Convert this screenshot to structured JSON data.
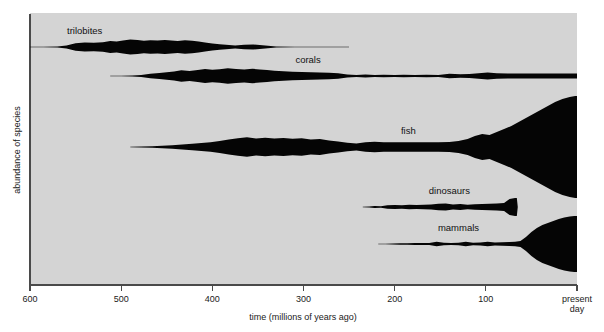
{
  "figure": {
    "type": "spindle-diagram",
    "background_color": "#ffffff",
    "panel_color": "#d4d4d4",
    "ink_color": "#050505",
    "axis_color": "#4a4a4a"
  },
  "axes": {
    "x": {
      "title": "time (millions of years ago)",
      "ticks": [
        {
          "value": 600,
          "label": "600"
        },
        {
          "value": 500,
          "label": "500"
        },
        {
          "value": 400,
          "label": "400"
        },
        {
          "value": 300,
          "label": "300"
        },
        {
          "value": 200,
          "label": "200"
        },
        {
          "value": 100,
          "label": "100"
        },
        {
          "value": 0,
          "label": "present\nday"
        }
      ],
      "range": [
        600,
        0
      ],
      "direction": "decreasing-left-to-right"
    },
    "y": {
      "title": "abundance of species",
      "ticks": [],
      "range": null
    }
  },
  "chart_data": {
    "type": "area",
    "title": "",
    "subtitle": "",
    "xlabel": "time (millions of years ago)",
    "ylabel": "abundance of species",
    "xlim": [
      600,
      0
    ],
    "ylim": null,
    "grid": false,
    "legend": "inline-labels",
    "series": [
      {
        "name": "trilobites",
        "label": "trilobites",
        "label_x": 540,
        "centerline_y_px": 47,
        "x": [
          600,
          585,
          570,
          560,
          550,
          540,
          530,
          520,
          512,
          505,
          498,
          490,
          482,
          475,
          468,
          460,
          452,
          445,
          438,
          430,
          422,
          415,
          408,
          400,
          392,
          385,
          375,
          365,
          355,
          345,
          330,
          310,
          290,
          270,
          250
        ],
        "thickness": [
          0.2,
          0.4,
          0.8,
          3.0,
          7.5,
          9.0,
          8.5,
          9.5,
          12.0,
          11.0,
          13.0,
          15.0,
          14.0,
          12.5,
          13.5,
          13.0,
          14.0,
          13.0,
          12.0,
          13.5,
          12.5,
          11.0,
          9.0,
          7.0,
          5.5,
          4.5,
          3.0,
          4.5,
          5.0,
          3.5,
          1.2,
          0.6,
          0.5,
          0.4,
          0.3
        ]
      },
      {
        "name": "corals",
        "label": "corals",
        "label_x": 295,
        "centerline_y_px": 76,
        "x": [
          512,
          500,
          488,
          478,
          468,
          458,
          450,
          442,
          434,
          425,
          416,
          408,
          400,
          392,
          383,
          374,
          365,
          356,
          348,
          340,
          332,
          322,
          312,
          302,
          292,
          282,
          272,
          262,
          252,
          242,
          232,
          222,
          212,
          200,
          190,
          178,
          165,
          152,
          140,
          128,
          118,
          108,
          98,
          88,
          76,
          62,
          48,
          34,
          20,
          8,
          0
        ],
        "thickness": [
          0.3,
          0.6,
          1.0,
          2.0,
          4.5,
          6.0,
          7.5,
          9.0,
          11.5,
          10.0,
          12.0,
          14.0,
          12.5,
          13.5,
          15.5,
          14.0,
          13.0,
          14.5,
          13.0,
          12.0,
          10.5,
          9.5,
          8.5,
          8.0,
          7.5,
          7.0,
          6.5,
          5.5,
          3.0,
          2.0,
          3.0,
          2.2,
          2.5,
          2.0,
          2.4,
          2.0,
          2.6,
          2.2,
          4.5,
          3.5,
          4.0,
          5.5,
          7.0,
          5.5,
          5.0,
          5.0,
          5.0,
          5.0,
          5.0,
          5.0,
          5.0
        ]
      },
      {
        "name": "fish",
        "label": "fish",
        "label_x": 185,
        "centerline_y_px": 147,
        "x": [
          490,
          478,
          466,
          455,
          444,
          433,
          422,
          412,
          402,
          392,
          382,
          372,
          362,
          352,
          342,
          332,
          322,
          312,
          302,
          292,
          282,
          272,
          262,
          252,
          242,
          232,
          222,
          212,
          200,
          188,
          176,
          164,
          152,
          140,
          130,
          120,
          112,
          104,
          96,
          88,
          80,
          72,
          64,
          56,
          48,
          40,
          32,
          24,
          16,
          8,
          2,
          0
        ],
        "thickness": [
          0.3,
          0.8,
          1.5,
          2.5,
          3.5,
          5.0,
          6.5,
          8.0,
          9.5,
          12.0,
          15.0,
          17.5,
          19.5,
          17.0,
          18.5,
          17.0,
          18.0,
          16.5,
          17.5,
          15.0,
          16.0,
          13.0,
          11.0,
          8.5,
          7.0,
          9.5,
          10.5,
          9.5,
          9.5,
          9.5,
          9.5,
          9.5,
          9.5,
          10.0,
          12.0,
          16.0,
          22.0,
          26.0,
          24.0,
          30.0,
          36.0,
          42.0,
          50.0,
          58.0,
          66.0,
          74.0,
          82.0,
          90.0,
          96.0,
          100.0,
          102.0,
          102.0
        ]
      },
      {
        "name": "dinosaurs",
        "label": "dinosaurs",
        "label_x": 140,
        "centerline_y_px": 207,
        "x": [
          235,
          228,
          222,
          215,
          208,
          200,
          192,
          184,
          176,
          168,
          160,
          152,
          144,
          136,
          128,
          120,
          112,
          104,
          96,
          88,
          80,
          74,
          68,
          66,
          65
        ],
        "thickness": [
          0.3,
          0.8,
          2.0,
          1.5,
          3.5,
          4.0,
          3.5,
          4.5,
          4.0,
          4.5,
          5.0,
          6.5,
          7.0,
          5.0,
          6.0,
          4.5,
          5.5,
          6.0,
          6.5,
          7.0,
          8.0,
          16.0,
          18.0,
          18.0,
          0.0
        ]
      },
      {
        "name": "mammals",
        "label": "mammals",
        "label_x": 130,
        "centerline_y_px": 244,
        "x": [
          218,
          210,
          202,
          194,
          186,
          178,
          170,
          162,
          154,
          146,
          138,
          130,
          122,
          114,
          106,
          98,
          90,
          82,
          74,
          68,
          62,
          56,
          50,
          44,
          38,
          32,
          26,
          20,
          14,
          8,
          3,
          0
        ],
        "thickness": [
          0.3,
          0.6,
          1.0,
          1.4,
          1.6,
          1.8,
          2.0,
          2.2,
          4.5,
          2.5,
          2.2,
          2.4,
          4.5,
          2.6,
          2.8,
          4.5,
          3.0,
          3.5,
          4.0,
          4.5,
          6.0,
          14.0,
          24.0,
          32.0,
          38.0,
          42.0,
          46.0,
          50.0,
          53.0,
          55.0,
          56.0,
          56.0
        ]
      }
    ]
  }
}
